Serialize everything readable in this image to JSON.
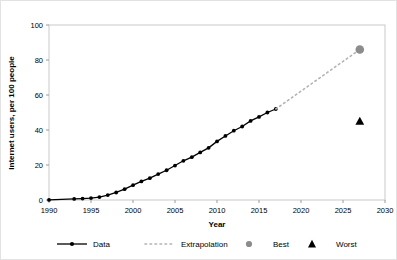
{
  "figure": {
    "background": "#ffffff",
    "border_color": "#e2e2e2"
  },
  "chart_data": {
    "type": "line",
    "title": "",
    "xlabel": "Year",
    "ylabel": "Internet users, per 100 people",
    "xlim": [
      1990,
      2030
    ],
    "ylim": [
      0,
      100
    ],
    "xticks": [
      1990,
      1995,
      2000,
      2005,
      2010,
      2015,
      2020,
      2025,
      2030
    ],
    "yticks": [
      0,
      20,
      40,
      60,
      80,
      100
    ],
    "grid": false,
    "legend_position": "bottom",
    "series": [
      {
        "name": "Data",
        "style": "solid-line-with-round-markers",
        "color": "#000000",
        "x": [
          1990,
          1993,
          1994,
          1995,
          1996,
          1997,
          1998,
          1999,
          2000,
          2001,
          2002,
          2003,
          2004,
          2005,
          2006,
          2007,
          2008,
          2009,
          2010,
          2011,
          2012,
          2013,
          2014,
          2015,
          2016,
          2017
        ],
        "values": [
          0.05,
          0.6,
          0.8,
          1.1,
          1.7,
          2.8,
          4.3,
          6.2,
          8.5,
          10.6,
          12.5,
          14.8,
          17.0,
          19.7,
          22.4,
          24.5,
          27.2,
          29.8,
          33.5,
          36.6,
          39.6,
          42.0,
          45.2,
          47.5,
          50.0,
          52.0
        ]
      },
      {
        "name": "Extrapolation",
        "style": "dotted-line",
        "color": "#b3b3b3",
        "x": [
          2017,
          2027
        ],
        "values": [
          52.0,
          86.0
        ]
      }
    ],
    "points": [
      {
        "name": "Best",
        "marker": "circle",
        "color": "#8c8c8c",
        "x": 2027,
        "y": 86.0
      },
      {
        "name": "Worst",
        "marker": "triangle",
        "color": "#000000",
        "x": 2027,
        "y": 45.0
      }
    ],
    "legend": [
      {
        "label": "Data",
        "marker": "line-with-dot",
        "color": "#000000"
      },
      {
        "label": "Extrapolation",
        "marker": "dotted-line",
        "color": "#b3b3b3"
      },
      {
        "label": "Best",
        "marker": "circle",
        "color": "#8c8c8c"
      },
      {
        "label": "Worst",
        "marker": "triangle",
        "color": "#000000"
      }
    ]
  }
}
